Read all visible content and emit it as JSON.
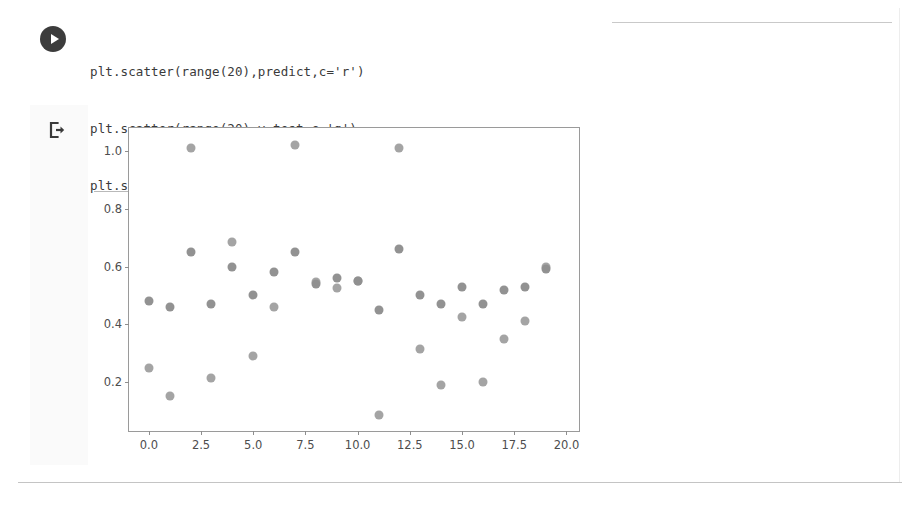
{
  "notebook": {
    "run_button_icon": "play-icon",
    "output_marker_icon": "output-arrow-icon",
    "code_lines": [
      "plt.scatter(range(20),predict,c='r')",
      "plt.scatter(range(20),y_test,c='g')",
      "plt.show()"
    ]
  },
  "colors": {
    "series_predict": "#7a7a7a",
    "series_y_test": "#909090",
    "axis": "#9a9a9a",
    "tick_text": "#4d4d4d",
    "code_text": "#3a3a3a",
    "run_button_bg": "#3c3c3c",
    "divider": "#c9c9c9"
  },
  "chart_data": {
    "type": "scatter",
    "title": "",
    "xlabel": "",
    "ylabel": "",
    "xlim": [
      -0.95,
      20.6
    ],
    "ylim": [
      0.03,
      1.08
    ],
    "grid": false,
    "legend": "none",
    "xticks": [
      "0.0",
      "2.5",
      "5.0",
      "7.5",
      "10.0",
      "12.5",
      "15.0",
      "17.5",
      "20.0"
    ],
    "xtick_values": [
      0.0,
      2.5,
      5.0,
      7.5,
      10.0,
      12.5,
      15.0,
      17.5,
      20.0
    ],
    "yticks": [
      "0.2",
      "0.4",
      "0.6",
      "0.8",
      "1.0"
    ],
    "ytick_values": [
      0.2,
      0.4,
      0.6,
      0.8,
      1.0
    ],
    "x": [
      0,
      1,
      2,
      3,
      4,
      5,
      6,
      7,
      8,
      9,
      10,
      11,
      12,
      13,
      14,
      15,
      16,
      17,
      18,
      19
    ],
    "series": [
      {
        "name": "predict",
        "color_code": "r",
        "marker_color": "#7a7a7a",
        "values": [
          0.48,
          0.46,
          0.65,
          0.47,
          0.6,
          0.5,
          0.58,
          0.65,
          0.54,
          0.56,
          0.55,
          0.45,
          0.66,
          0.5,
          0.47,
          0.53,
          0.47,
          0.52,
          0.53,
          0.59
        ]
      },
      {
        "name": "y_test",
        "color_code": "g",
        "marker_color": "#909090",
        "values": [
          0.25,
          0.15,
          1.01,
          0.215,
          0.685,
          0.29,
          0.46,
          1.02,
          0.545,
          0.525,
          0.55,
          0.085,
          1.01,
          0.315,
          0.19,
          0.425,
          0.2,
          0.35,
          0.41,
          0.6
        ]
      }
    ]
  }
}
